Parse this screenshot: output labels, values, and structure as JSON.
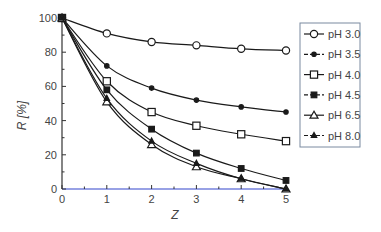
{
  "chart_data": {
    "type": "line",
    "title": "",
    "xlabel": "Z",
    "ylabel": "R [%]",
    "xlim": [
      0,
      5
    ],
    "ylim": [
      0,
      100
    ],
    "x_ticks": [
      0,
      1,
      2,
      3,
      4,
      5
    ],
    "y_ticks": [
      0,
      20,
      40,
      60,
      80,
      100
    ],
    "grid": false,
    "legend_position": "right",
    "x": [
      0,
      1,
      2,
      3,
      4,
      5
    ],
    "series": [
      {
        "name": "pH 3.0",
        "marker": "open-circle",
        "values": [
          100,
          91,
          86,
          84,
          82,
          81
        ]
      },
      {
        "name": "pH 3.5",
        "marker": "small-filled-circle",
        "values": [
          100,
          72,
          59,
          52,
          48,
          45
        ]
      },
      {
        "name": "pH 4.0",
        "marker": "open-square",
        "values": [
          100,
          63,
          45,
          37,
          32,
          28
        ]
      },
      {
        "name": "pH 4.5",
        "marker": "filled-square",
        "values": [
          100,
          58,
          35,
          21,
          12,
          5
        ]
      },
      {
        "name": "pH 6.5",
        "marker": "open-triangle",
        "values": [
          100,
          51,
          26,
          13,
          6,
          0
        ]
      },
      {
        "name": "pH 8.0",
        "marker": "small-filled-triangle",
        "values": [
          100,
          53,
          28,
          15,
          6,
          0
        ]
      }
    ]
  },
  "colors": {
    "line": "#1a1a1a",
    "axis": "#333333",
    "text": "#444444",
    "legend_border": "#7a8aa0",
    "baseline": "#3344cc"
  }
}
